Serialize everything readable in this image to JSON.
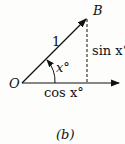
{
  "diagram": {
    "origin_label": "O",
    "point_label": "B",
    "hypotenuse_label": "1",
    "opposite_label": "sin x°",
    "adjacent_label": "cos x°",
    "angle_label": "x°",
    "caption": "(b)"
  }
}
